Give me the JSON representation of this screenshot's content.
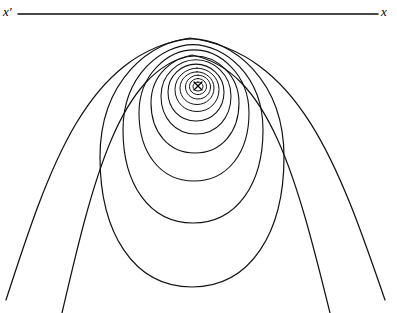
{
  "figure": {
    "background_color": "#ffffff",
    "stroke_color": "#111111",
    "width": 397,
    "height": 313
  },
  "axis": {
    "label_left": "x'",
    "label_right": "x",
    "y": 14,
    "x_start": 18,
    "x_end": 378,
    "stroke_width": 1.5
  },
  "center_marker": {
    "symbol": "x",
    "cx": 198,
    "cy": 86,
    "size": 4
  },
  "chart_data": {
    "type": "line",
    "xlabel": "",
    "ylabel": "",
    "grid": false,
    "legend": null,
    "annotations": [
      {
        "text": "x'",
        "x": 8,
        "y": 14
      },
      {
        "text": "x",
        "x": 386,
        "y": 14
      },
      {
        "text": "x",
        "x": 198,
        "y": 86
      }
    ],
    "series": [
      {
        "name": "contour-1",
        "closed": true,
        "cx": 198,
        "cy": 86.5,
        "rx": 5.0,
        "ry": 4.5,
        "bulge": 0.02,
        "stroke_width": 1.0
      },
      {
        "name": "contour-2",
        "closed": true,
        "cx": 198,
        "cy": 86.5,
        "rx": 8.5,
        "ry": 8.0,
        "bulge": 0.04,
        "stroke_width": 1.0
      },
      {
        "name": "contour-3",
        "closed": true,
        "cx": 198,
        "cy": 87.0,
        "rx": 12.5,
        "ry": 12.0,
        "bulge": 0.06,
        "stroke_width": 1.0
      },
      {
        "name": "contour-4",
        "closed": true,
        "cx": 197,
        "cy": 88.0,
        "rx": 17.0,
        "ry": 16.5,
        "bulge": 0.09,
        "stroke_width": 1.0
      },
      {
        "name": "contour-5",
        "closed": true,
        "cx": 197,
        "cy": 89.5,
        "rx": 22.0,
        "ry": 22.0,
        "bulge": 0.12,
        "stroke_width": 1.0
      },
      {
        "name": "contour-6",
        "closed": true,
        "cx": 196,
        "cy": 92.0,
        "rx": 28.0,
        "ry": 29.0,
        "bulge": 0.16,
        "stroke_width": 1.05
      },
      {
        "name": "contour-7",
        "closed": true,
        "cx": 196,
        "cy": 96.0,
        "rx": 35.0,
        "ry": 38.0,
        "bulge": 0.2,
        "stroke_width": 1.05
      },
      {
        "name": "contour-8",
        "closed": true,
        "cx": 195,
        "cy": 103.0,
        "rx": 44.0,
        "ry": 50.0,
        "bulge": 0.25,
        "stroke_width": 1.1
      },
      {
        "name": "contour-9",
        "closed": true,
        "cx": 194,
        "cy": 113.0,
        "rx": 55.0,
        "ry": 68.0,
        "bulge": 0.3,
        "stroke_width": 1.1
      },
      {
        "name": "contour-10",
        "closed": true,
        "cx": 193,
        "cy": 130.0,
        "rx": 70.0,
        "ry": 93.0,
        "bulge": 0.34,
        "stroke_width": 1.15
      },
      {
        "name": "contour-11",
        "closed": true,
        "cx": 192,
        "cy": 157.0,
        "rx": 92.0,
        "ry": 130.0,
        "bulge": 0.38,
        "stroke_width": 1.2
      },
      {
        "name": "contour-12-open-inner",
        "closed": false,
        "apex_x": 192,
        "apex_y": 55,
        "end_left_x": 62,
        "end_left_y": 313,
        "end_right_x": 330,
        "end_right_y": 313,
        "stroke_width": 1.2
      },
      {
        "name": "contour-13-open-outer",
        "closed": false,
        "apex_x": 190,
        "apex_y": 38,
        "end_left_x": 6,
        "end_left_y": 300,
        "end_right_x": 385,
        "end_right_y": 300,
        "stroke_width": 1.25
      }
    ]
  }
}
